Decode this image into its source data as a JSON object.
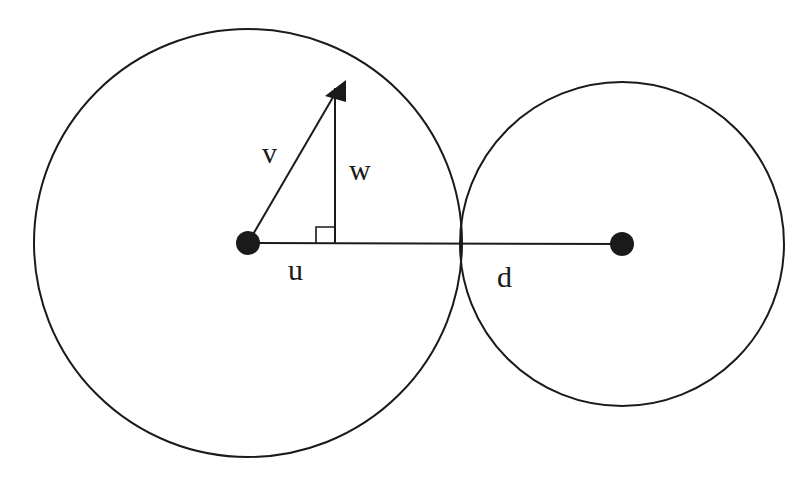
{
  "diagram": {
    "stroke_color": "#1a1a1a",
    "background": "#ffffff",
    "circles": [
      {
        "name": "large-circle",
        "cx": 248,
        "cy": 243,
        "r": 214
      },
      {
        "name": "small-circle",
        "cx": 622,
        "cy": 244,
        "r": 162
      }
    ],
    "points": [
      {
        "name": "large-center",
        "x": 248,
        "y": 243
      },
      {
        "name": "small-center",
        "x": 622,
        "y": 244
      }
    ],
    "labels": {
      "v": "v",
      "w": "w",
      "u": "u",
      "d": "d"
    }
  }
}
